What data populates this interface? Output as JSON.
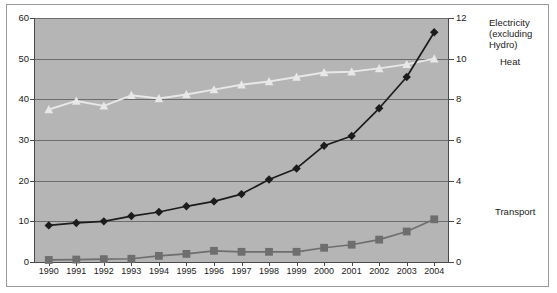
{
  "chart_data": {
    "type": "line",
    "title": "",
    "xlabel": "",
    "ylabel": "",
    "grid": true,
    "legend_position": "right-inline",
    "categories": [
      "1990",
      "1991",
      "1992",
      "1993",
      "1994",
      "1995",
      "1996",
      "1997",
      "1998",
      "1999",
      "2000",
      "2001",
      "2002",
      "2003",
      "2004"
    ],
    "axes": {
      "left": {
        "min": 0,
        "max": 60,
        "step": 10,
        "ticks": [
          "0",
          "10",
          "20",
          "30",
          "40",
          "50",
          "60"
        ]
      },
      "right": {
        "min": 0,
        "max": 12,
        "step": 2,
        "ticks": [
          "0",
          "2",
          "4",
          "6",
          "8",
          "10",
          "12"
        ]
      },
      "x": {
        "ticks": [
          "1990",
          "1991",
          "1992",
          "1993",
          "1994",
          "1995",
          "1996",
          "1997",
          "1998",
          "1999",
          "2000",
          "2001",
          "2002",
          "2003",
          "2004"
        ]
      }
    },
    "series": [
      {
        "name": "Electricity (excluding Hydro)",
        "label": "Electricity (excluding Hydro)",
        "axis": "left",
        "color": "#1c1c1c",
        "marker": "diamond",
        "values": [
          9.0,
          9.6,
          10.0,
          11.3,
          12.3,
          13.7,
          14.9,
          16.7,
          20.3,
          23.0,
          28.6,
          31.0,
          37.8,
          45.5,
          56.5
        ]
      },
      {
        "name": "Heat",
        "label": "Heat",
        "axis": "left",
        "color": "#e8e8e8",
        "marker": "triangle",
        "values": [
          37.5,
          39.6,
          38.4,
          41.0,
          40.2,
          41.2,
          42.4,
          43.6,
          44.4,
          45.5,
          46.6,
          46.8,
          47.6,
          48.6,
          50.0
        ]
      },
      {
        "name": "Transport",
        "label": "Transport",
        "axis": "right",
        "color": "#6e6e6e",
        "marker": "square",
        "values": [
          0.1,
          0.12,
          0.14,
          0.16,
          0.3,
          0.4,
          0.55,
          0.5,
          0.5,
          0.5,
          0.7,
          0.85,
          1.1,
          1.5,
          2.1
        ]
      }
    ]
  },
  "colors": {
    "plot_background": "#b5b5b5",
    "gridline": "#6d6d6d",
    "axis": "#4a4a4a",
    "frame": "#9a9a9a",
    "page_background": "#ffffff",
    "text": "#1a1a1a"
  },
  "labels": {
    "electricity": "Electricity (excluding Hydro)",
    "electricity_line1": "Electricity",
    "electricity_line2": "(excluding Hydro)",
    "heat": "Heat",
    "transport": "Transport"
  }
}
